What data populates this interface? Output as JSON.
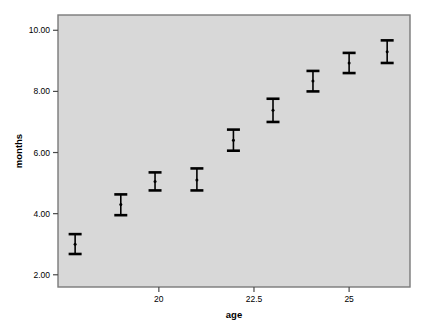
{
  "chart_data": {
    "type": "scatter",
    "title": "",
    "subtitle": "",
    "xlabel": "age",
    "ylabel": "months",
    "xlim": [
      17.35,
      26.6
    ],
    "ylim": [
      1.6,
      10.5
    ],
    "xticks": [
      "20",
      "22.5",
      "25"
    ],
    "xtick_values": [
      20,
      22.5,
      25
    ],
    "yticks": [
      "2.00",
      "4.00",
      "6.00",
      "8.00",
      "10.00"
    ],
    "ytick_values": [
      2,
      4,
      6,
      8,
      10
    ],
    "grid": false,
    "legend": null,
    "error_bar_style": "capped-vertical",
    "series": [
      {
        "name": "months",
        "x": [
          17.8,
          19.0,
          19.9,
          21.0,
          21.96,
          23.0,
          24.05,
          25.0,
          26.0
        ],
        "values": [
          3.0,
          4.3,
          5.05,
          5.1,
          6.4,
          7.38,
          8.34,
          8.93,
          9.3
        ],
        "ci_low": [
          2.68,
          3.95,
          4.76,
          4.76,
          6.06,
          7.0,
          8.0,
          8.6,
          8.93
        ],
        "ci_high": [
          3.33,
          4.63,
          5.35,
          5.48,
          6.75,
          7.76,
          8.67,
          9.26,
          9.67
        ]
      }
    ],
    "colors": {
      "plot_background": "#d8d8d8",
      "page_background": "#ffffff",
      "marker": "#000000",
      "error_bar": "#000000",
      "frame": "#7a7a7a"
    }
  }
}
